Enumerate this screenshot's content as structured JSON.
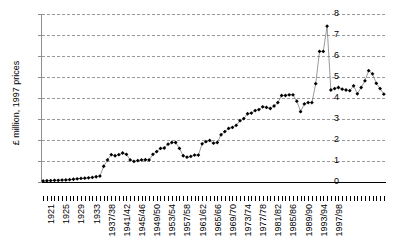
{
  "chart_data": {
    "type": "line",
    "title": "",
    "xlabel": "",
    "ylabel": "£ million, 1997 prices",
    "ylim": [
      0,
      8
    ],
    "yticks": [
      0,
      1,
      2,
      3,
      4,
      5,
      6,
      7,
      8
    ],
    "ytick_labels": [
      "0",
      "1",
      "2",
      "3",
      "4",
      "5",
      "6",
      "7",
      "8"
    ],
    "grid": true,
    "legend": null,
    "marker": "filled-diamond",
    "categories": [
      "1921",
      "1922",
      "1923",
      "1924",
      "1925",
      "1926",
      "1927",
      "1928",
      "1929",
      "1930",
      "1931",
      "1932",
      "1933",
      "1934",
      "1935",
      "1936",
      "1937/38",
      "1938/39",
      "1939/40",
      "1940/41",
      "1941/42",
      "1942/43",
      "1943/44",
      "1944/45",
      "1945/46",
      "1946/47",
      "1947/48",
      "1948/49",
      "1949/50",
      "1950/51",
      "1951/52",
      "1952/53",
      "1953/54",
      "1954/55",
      "1955/56",
      "1956/57",
      "1957/58",
      "1958/59",
      "1959/60",
      "1960/61",
      "1961/62",
      "1962/63",
      "1963/64",
      "1964/65",
      "1965/66",
      "1966/67",
      "1967/68",
      "1968/69",
      "1969/70",
      "1970/71",
      "1971/72",
      "1972/73",
      "1973/74",
      "1974/75",
      "1975/76",
      "1976/77",
      "1977/78",
      "1978/79",
      "1979/80",
      "1980/81",
      "1981/82",
      "1982/83",
      "1983/84",
      "1984/85",
      "1985/86",
      "1986/87",
      "1987/88",
      "1988/89",
      "1989/90",
      "1990/91",
      "1991/92",
      "1992/93",
      "1993/94",
      "1994/95",
      "1995/96",
      "1996/97",
      "1997/98"
    ],
    "xtick_labels_shown": [
      "1921",
      "1925",
      "1929",
      "1933",
      "1937/38",
      "1941/42",
      "1945/46",
      "1949/50",
      "1953/54",
      "1957/58",
      "1961/62",
      "1965/66",
      "1969/70",
      "1973/74",
      "1977/78",
      "1981/82",
      "1985/86",
      "1989/90",
      "1993/94",
      "1997/98"
    ],
    "values": [
      0.05,
      0.06,
      0.07,
      0.08,
      0.08,
      0.09,
      0.1,
      0.11,
      0.13,
      0.15,
      0.17,
      0.18,
      0.2,
      0.22,
      0.25,
      0.28,
      0.75,
      1.05,
      1.3,
      1.25,
      1.3,
      1.38,
      1.32,
      1.05,
      0.98,
      1.02,
      1.05,
      1.06,
      1.05,
      1.32,
      1.45,
      1.6,
      1.62,
      1.8,
      1.88,
      1.88,
      1.6,
      1.25,
      1.18,
      1.22,
      1.28,
      1.28,
      1.82,
      1.92,
      1.98,
      1.85,
      1.88,
      2.25,
      2.4,
      2.55,
      2.6,
      2.7,
      2.92,
      3.02,
      3.25,
      3.28,
      3.4,
      3.45,
      3.58,
      3.55,
      3.5,
      3.62,
      3.78,
      4.12,
      4.12,
      4.15,
      4.15,
      3.85,
      3.35,
      3.72,
      3.78,
      3.78,
      4.68,
      6.22,
      6.22,
      7.42,
      4.38
    ],
    "values_tail": [
      4.45,
      4.5,
      4.42,
      4.38,
      4.35,
      4.58,
      4.2,
      4.5,
      4.82,
      5.3,
      5.15,
      4.7,
      4.45,
      4.18
    ]
  }
}
